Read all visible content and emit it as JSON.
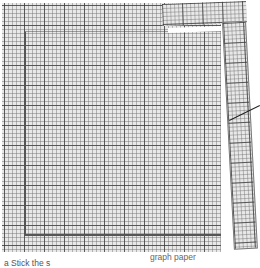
{
  "diagram": {
    "labels": {
      "graph_paper": "graph paper",
      "step_caption": "a  Stick the s"
    },
    "colors": {
      "paper": "#e8e8e8",
      "major_grid": "#3c3c3c",
      "minor_grid": "#6e6e6e",
      "leader_line": "#222222"
    }
  }
}
